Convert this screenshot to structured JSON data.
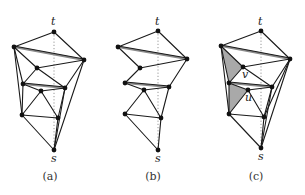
{
  "figure": {
    "panels": [
      {
        "caption": "(a)",
        "caption_pos": [
          50,
          180
        ],
        "labels": [
          {
            "text": "t",
            "x": 51,
            "y": 25
          },
          {
            "text": "s",
            "x": 51,
            "y": 162
          }
        ],
        "vertices": {
          "t": [
            54,
            32
          ],
          "lt": [
            14,
            47
          ],
          "r": [
            84,
            60
          ],
          "m1": [
            37,
            68
          ],
          "l2": [
            23,
            84
          ],
          "r2": [
            65,
            88
          ],
          "m2": [
            41,
            91
          ],
          "l3": [
            22,
            115
          ],
          "r3": [
            58,
            118
          ],
          "s": [
            54,
            150
          ]
        },
        "edges": [
          [
            "t",
            "lt"
          ],
          [
            "t",
            "r"
          ],
          [
            "lt",
            "m1"
          ],
          [
            "m1",
            "r"
          ],
          [
            "lt",
            "l2"
          ],
          [
            "lt",
            "l3"
          ],
          [
            "m1",
            "l2"
          ],
          [
            "m1",
            "r2"
          ],
          [
            "r",
            "r2"
          ],
          [
            "r",
            "s"
          ],
          [
            "l2",
            "m2"
          ],
          [
            "m2",
            "r2"
          ],
          [
            "l2",
            "l3"
          ],
          [
            "m2",
            "l3"
          ],
          [
            "m2",
            "r3"
          ],
          [
            "r2",
            "r3"
          ],
          [
            "r2",
            "s"
          ],
          [
            "l3",
            "r3"
          ],
          [
            "l3",
            "s"
          ],
          [
            "r3",
            "s"
          ]
        ],
        "heavy_edges": [
          [
            "lt",
            "r"
          ],
          [
            "l2",
            "r2"
          ]
        ],
        "shaded": []
      },
      {
        "caption": "(b)",
        "caption_pos": [
          153,
          180
        ],
        "labels": [
          {
            "text": "t",
            "x": 155,
            "y": 25
          },
          {
            "text": "s",
            "x": 155,
            "y": 162
          }
        ],
        "vertices": {
          "t": [
            158,
            31
          ],
          "lt": [
            118,
            47
          ],
          "r": [
            187,
            59
          ],
          "m1": [
            140,
            68
          ],
          "l2": [
            125,
            83
          ],
          "r2": [
            169,
            87
          ],
          "m2": [
            144,
            90
          ],
          "l3": [
            125,
            114
          ],
          "r3": [
            161,
            118
          ],
          "s": [
            158,
            150
          ]
        },
        "edges": [
          [
            "t",
            "lt"
          ],
          [
            "t",
            "r"
          ],
          [
            "lt",
            "m1"
          ],
          [
            "m1",
            "r"
          ],
          [
            "m1",
            "l2"
          ],
          [
            "r",
            "r2"
          ],
          [
            "l2",
            "m2"
          ],
          [
            "m2",
            "r2"
          ],
          [
            "m2",
            "l3"
          ],
          [
            "m2",
            "r3"
          ],
          [
            "r2",
            "r3"
          ],
          [
            "l3",
            "r3"
          ],
          [
            "l3",
            "s"
          ],
          [
            "r3",
            "s"
          ]
        ],
        "heavy_edges": [
          [
            "lt",
            "r"
          ],
          [
            "l2",
            "r2"
          ]
        ],
        "shaded": []
      },
      {
        "caption": "(c)",
        "caption_pos": [
          256,
          180
        ],
        "labels": [
          {
            "text": "t",
            "x": 258,
            "y": 25
          },
          {
            "text": "s",
            "x": 258,
            "y": 160
          },
          {
            "text": "v",
            "x": 242,
            "y": 78
          },
          {
            "text": "u",
            "x": 245,
            "y": 101
          }
        ],
        "vertices": {
          "t": [
            261,
            31
          ],
          "lt": [
            221,
            46
          ],
          "r": [
            290,
            59
          ],
          "v": [
            243,
            67
          ],
          "l2": [
            229,
            83
          ],
          "r2": [
            272,
            87
          ],
          "u": [
            248,
            90
          ],
          "l3": [
            229,
            114
          ],
          "r3": [
            264,
            117
          ],
          "s": [
            261,
            148
          ]
        },
        "edges": [
          [
            "t",
            "lt"
          ],
          [
            "t",
            "r"
          ],
          [
            "lt",
            "v"
          ],
          [
            "v",
            "r"
          ],
          [
            "lt",
            "l2"
          ],
          [
            "lt",
            "l3"
          ],
          [
            "v",
            "l2"
          ],
          [
            "v",
            "r2"
          ],
          [
            "r",
            "r2"
          ],
          [
            "r",
            "r3"
          ],
          [
            "r",
            "s"
          ],
          [
            "l2",
            "u"
          ],
          [
            "u",
            "r2"
          ],
          [
            "l2",
            "l3"
          ],
          [
            "u",
            "l3"
          ],
          [
            "u",
            "r3"
          ],
          [
            "r2",
            "r3"
          ],
          [
            "r2",
            "s"
          ],
          [
            "l3",
            "r3"
          ],
          [
            "l3",
            "s"
          ],
          [
            "r3",
            "s"
          ]
        ],
        "heavy_edges": [
          [
            "lt",
            "r"
          ],
          [
            "l2",
            "r2"
          ]
        ],
        "shaded": [
          [
            "lt",
            "v",
            "l2"
          ],
          [
            "l2",
            "u",
            "l3"
          ]
        ]
      }
    ],
    "colors": {
      "edge": "#1a1a1a",
      "heavy_edge": "#8a8a8a",
      "dotted": "#8c8c8c",
      "shade": "#a9a9a9",
      "vertex": "#111111"
    }
  }
}
